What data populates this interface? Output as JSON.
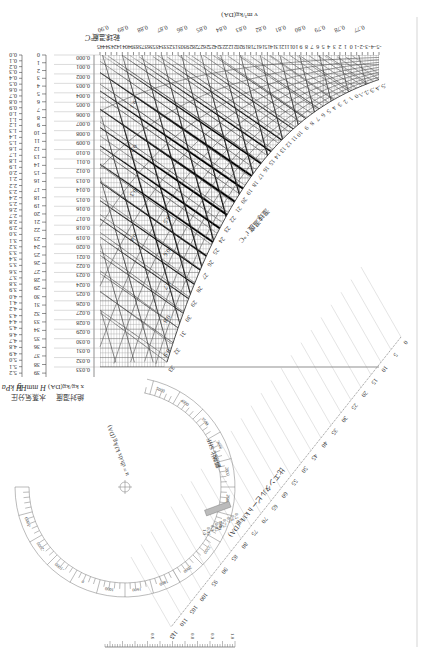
{
  "orientation": "rotated-180",
  "chart_data": {
    "type": "psychrometric",
    "title": "",
    "x_axis": {
      "label": "乾球温度 t °C",
      "ticks": [
        -5,
        -4,
        -3,
        -2,
        -1,
        0,
        1,
        2,
        3,
        4,
        5,
        6,
        7,
        8,
        9,
        10,
        11,
        12,
        13,
        14,
        15,
        16,
        17,
        18,
        19,
        20,
        21,
        22,
        23,
        24,
        25,
        26,
        27,
        28,
        29,
        30,
        31,
        32,
        33,
        34,
        35,
        36,
        37,
        38,
        39,
        40,
        41,
        42,
        43,
        44,
        45
      ],
      "range": [
        -5,
        45
      ]
    },
    "humidity_ratio_axis": {
      "label": "x kg/kg(DA)",
      "label_jp": "絶対湿度",
      "ticks": [
        "0.000",
        "0.001",
        "0.002",
        "0.003",
        "0.004",
        "0.005",
        "0.006",
        "0.007",
        "0.008",
        "0.009",
        "0.010",
        "0.011",
        "0.012",
        "0.013",
        "0.014",
        "0.015",
        "0.016",
        "0.017",
        "0.018",
        "0.019",
        "0.020",
        "0.021",
        "0.022",
        "0.023",
        "0.024",
        "0.025",
        "0.026",
        "0.027",
        "0.028",
        "0.029",
        "0.030",
        "0.031",
        "0.032",
        "0.033"
      ],
      "range": [
        0.0,
        0.033
      ]
    },
    "vapor_pressure_mmHg": {
      "label": "H mmHg",
      "label_jp": "水蒸気分圧",
      "ticks": [
        0,
        1,
        2,
        3,
        4,
        5,
        6,
        7,
        8,
        9,
        10,
        11,
        12,
        13,
        14,
        15,
        16,
        17,
        18,
        19,
        20,
        21,
        22,
        23,
        24,
        25,
        26,
        27,
        28,
        29,
        30,
        31,
        32,
        33,
        34,
        35,
        36,
        37,
        38,
        39
      ]
    },
    "vapor_pressure_kPa": {
      "label": "H kPa",
      "ticks": [
        "0.0",
        "0.1",
        "0.2",
        "0.3",
        "0.4",
        "0.5",
        "0.6",
        "0.7",
        "0.8",
        "0.9",
        "1.0",
        "1.1",
        "1.2",
        "1.3",
        "1.4",
        "1.5",
        "1.6",
        "1.7",
        "1.8",
        "1.9",
        "2.0",
        "2.1",
        "2.2",
        "2.3",
        "2.4",
        "2.5",
        "2.6",
        "2.7",
        "2.8",
        "2.9",
        "3.0",
        "3.1",
        "3.2",
        "3.3",
        "3.4",
        "3.5",
        "3.6",
        "3.7",
        "3.8",
        "3.9",
        "4.0",
        "4.1",
        "4.2",
        "4.3",
        "4.4",
        "4.5",
        "4.6",
        "4.7",
        "4.8",
        "4.9",
        "5.0",
        "5.1",
        "5.2"
      ]
    },
    "specific_volume": {
      "label": "v m³/kg(DA)",
      "values": [
        "0.77",
        "0.78",
        "0.79",
        "0.80",
        "0.81",
        "0.82",
        "0.83",
        "0.84",
        "0.85",
        "0.86",
        "0.87",
        "0.88",
        "0.89",
        "0.90",
        "0.91",
        "0.92",
        "0.93",
        "0.94"
      ]
    },
    "enthalpy": {
      "label": "比エンタルピー h kJ/kg(DA)",
      "values": [
        0,
        5,
        10,
        15,
        20,
        25,
        30,
        35,
        40,
        45,
        50,
        55,
        60,
        65,
        70,
        75,
        80,
        85,
        90,
        95,
        100,
        105,
        110,
        115
      ]
    },
    "wet_bulb": {
      "label": "湿球温度 t' °C",
      "values": [
        -5,
        -4,
        -3,
        -2,
        -1,
        0,
        1,
        2,
        3,
        4,
        5,
        6,
        7,
        8,
        9,
        10,
        11,
        12,
        13,
        14,
        15,
        16,
        17,
        18,
        19,
        20,
        21,
        22,
        23,
        24,
        25,
        26,
        27,
        28,
        29,
        30,
        31,
        32,
        33
      ]
    },
    "relative_humidity": {
      "label": "相対湿度 %",
      "values": [
        10,
        20,
        30,
        40,
        50,
        60,
        70,
        80,
        90,
        100
      ]
    },
    "shf_protractor": {
      "label": "顕熱比 SHF",
      "formula": "u = dh/dx kJ/kg",
      "shf_values_inner": [
        "0.5",
        "0.6",
        "0.7",
        "0.75",
        "0.8",
        "0.85",
        "0.9",
        "0.95",
        "1.0"
      ],
      "shf_values_outer": [
        "1.0",
        "0.9",
        "0.8",
        "0.7",
        "0.6"
      ],
      "u_values": [
        "-5000",
        "-2000",
        "-1000",
        "0",
        "1000",
        "1600",
        "1800",
        "2000",
        "2200",
        "2400",
        "2600",
        "2800",
        "3000",
        "3500",
        "4000",
        "5000"
      ]
    }
  },
  "labels": {
    "pressure_kpa": "H kPa",
    "pressure_mmhg": "H mmHg",
    "pressure_jp": "水蒸気分圧",
    "humidity_ratio": "x kg/kg(DA)",
    "humidity_ratio_jp": "絶対湿度",
    "dry_bulb": "t °C",
    "dry_bulb_jp": "乾球温度",
    "volume": "v m³/kg(DA)",
    "enthalpy": "h kJ/kg(DA)",
    "enthalpy_jp": "比エンタルピー",
    "wet_bulb_jp": "湿球温度",
    "wet_bulb": "t' °C",
    "shf": "顕熱比 SHF",
    "formula": "u = dh/dx kJ/kg (DA)"
  }
}
